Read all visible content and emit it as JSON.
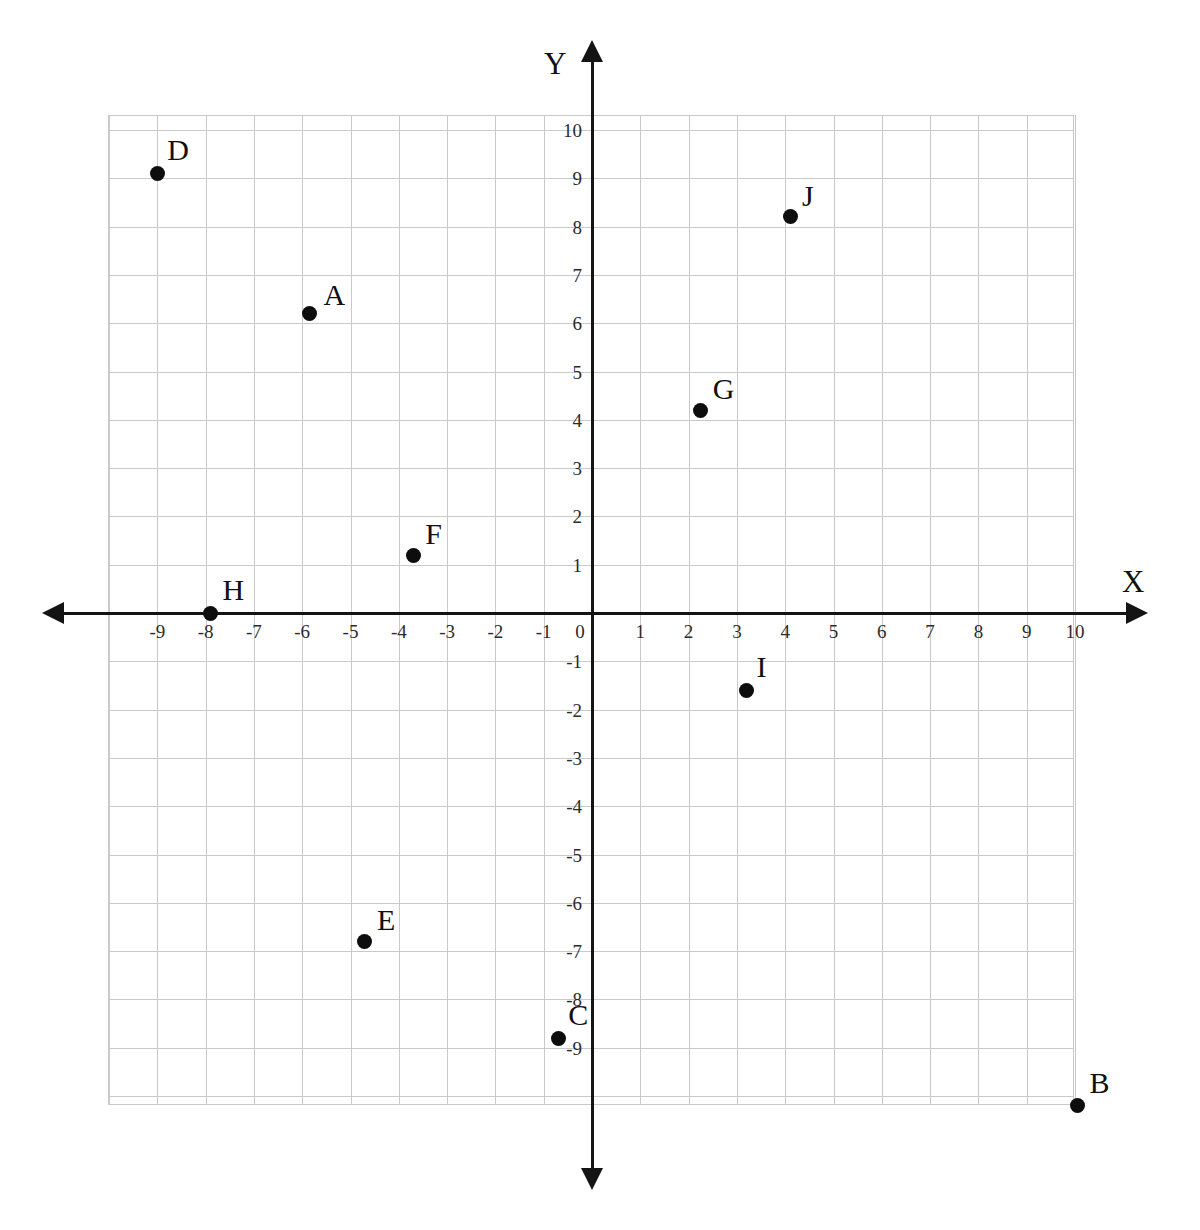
{
  "chart_data": {
    "type": "scatter",
    "title": "",
    "xlabel": "X",
    "ylabel": "Y",
    "xlim": [
      -10,
      10
    ],
    "ylim": [
      -10,
      10
    ],
    "grid": true,
    "legend": "none",
    "x_tick_labels": [
      "-9",
      "-8",
      "-7",
      "-6",
      "-5",
      "-4",
      "-3",
      "-2",
      "-1",
      "0",
      "1",
      "2",
      "3",
      "4",
      "5",
      "6",
      "7",
      "8",
      "9",
      "10"
    ],
    "x_tick_values": [
      -9,
      -8,
      -7,
      -6,
      -5,
      -4,
      -3,
      -2,
      -1,
      0,
      1,
      2,
      3,
      4,
      5,
      6,
      7,
      8,
      9,
      10
    ],
    "y_tick_labels": [
      "10",
      "9",
      "8",
      "7",
      "6",
      "5",
      "4",
      "3",
      "2",
      "1",
      "0",
      "-1",
      "-2",
      "-3",
      "-4",
      "-5",
      "-6",
      "-7",
      "-8",
      "-9"
    ],
    "y_tick_values": [
      10,
      9,
      8,
      7,
      6,
      5,
      4,
      3,
      2,
      1,
      0,
      -1,
      -2,
      -3,
      -4,
      -5,
      -6,
      -7,
      -8,
      -9
    ],
    "points": [
      {
        "label": "A",
        "x": -5.85,
        "y": 6.2,
        "label_dx": 14,
        "label_dy": -34
      },
      {
        "label": "B",
        "x": 10.05,
        "y": -10.2,
        "label_dx": 12,
        "label_dy": -38
      },
      {
        "label": "C",
        "x": -0.7,
        "y": -8.8,
        "label_dx": 10,
        "label_dy": -38
      },
      {
        "label": "D",
        "x": -9.0,
        "y": 9.1,
        "label_dx": 10,
        "label_dy": -38
      },
      {
        "label": "E",
        "x": -4.7,
        "y": -6.8,
        "label_dx": 12,
        "label_dy": -36
      },
      {
        "label": "F",
        "x": -3.7,
        "y": 1.2,
        "label_dx": 12,
        "label_dy": -36
      },
      {
        "label": "G",
        "x": 2.25,
        "y": 4.2,
        "label_dx": 12,
        "label_dy": -36
      },
      {
        "label": "H",
        "x": -7.9,
        "y": 0.0,
        "label_dx": 12,
        "label_dy": -38
      },
      {
        "label": "I",
        "x": 3.2,
        "y": -1.6,
        "label_dx": 10,
        "label_dy": -38
      },
      {
        "label": "J",
        "x": 4.1,
        "y": 8.2,
        "label_dx": 12,
        "label_dy": -36
      }
    ],
    "colors": {
      "point": "#0d0d0d",
      "axis": "#141414",
      "gridline": "#c9c9c9",
      "background": "#ffffff",
      "tick_text": "#2b2b2b"
    }
  },
  "axis_names": {
    "x": "X",
    "y": "Y"
  }
}
